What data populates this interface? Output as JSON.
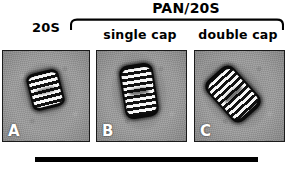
{
  "figure": {
    "group_header": {
      "title": "PAN/20S",
      "bracket_name": "group-bracket"
    },
    "column_labels": {
      "left": "20S",
      "middle": "single cap",
      "right": "double cap"
    },
    "panels": [
      {
        "letter": "A",
        "condition": "20S",
        "particle": "proteasome-barrel-20s",
        "stripe_count": 4,
        "orientation_deg": -14,
        "background_hex": "#9e9e9e"
      },
      {
        "letter": "B",
        "condition": "single cap",
        "particle": "proteasome-single-capped",
        "stripe_count": 6,
        "orientation_deg": -9,
        "background_hex": "#9e9e9e"
      },
      {
        "letter": "C",
        "condition": "double cap",
        "particle": "proteasome-double-capped",
        "stripe_count": 7,
        "orientation_deg": -42,
        "background_hex": "#9e9e9e"
      }
    ],
    "scale_bar": {
      "name": "scale-bar",
      "color_hex": "#000000"
    },
    "colors": {
      "ink": "#000000",
      "panel_border": "#1a1a1a",
      "panel_background": "#9e9e9e",
      "particle_dark": "#0b0b0b",
      "particle_light": "#f6f6f6",
      "letter_label": "#ffffff"
    }
  }
}
